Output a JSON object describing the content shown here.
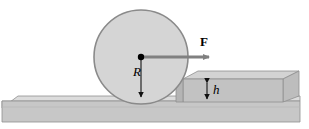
{
  "figure": {
    "name": "wheel-over-step-free-body-diagram",
    "background_color": "#ffffff",
    "width": 309,
    "height": 129
  },
  "labels": {
    "force": "F",
    "radius": "R",
    "step_height": "h"
  },
  "colors": {
    "wheel_fill": "#d5d5d5",
    "wheel_stroke": "#8a8a8a",
    "slab_top": "#d9d9d9",
    "slab_front": "#c6c6c6",
    "slab_side": "#b5b5b5",
    "step_top": "#d2d2d2",
    "step_front": "#bdbdbd",
    "outline": "#8f8f8f",
    "arrow_fill": "#808080",
    "dimension_line": "#1a1a1a",
    "center_dot": "#000000"
  },
  "geometry": {
    "wheel": {
      "cx": 141,
      "cy": 57,
      "r": 47
    },
    "center_dot_radius": 3,
    "force_arrow": {
      "x1": 141,
      "y1": 57,
      "x2": 216,
      "y2": 57,
      "direction": "right"
    },
    "radius_arrow": {
      "x1": 141,
      "y1": 57,
      "x2": 141,
      "y2": 103,
      "direction": "down"
    },
    "height_arrow": {
      "x": 207,
      "y1": 79,
      "y2": 103,
      "direction": "both"
    },
    "lower_slab": {
      "left": 2,
      "right": 300,
      "top_front": 101,
      "bottom": 122,
      "back_top": 95,
      "depth_x": 16,
      "depth_y": 7
    },
    "upper_step": {
      "left": 183,
      "right": 299,
      "top_front": 79,
      "bottom": 102,
      "back_top": 71,
      "depth_x": 15,
      "depth_y": 8
    }
  },
  "elements": {
    "wheel_name": "wheel-circle",
    "lower_slab_name": "lower-slab",
    "upper_step_name": "upper-step-block",
    "force_arrow_name": "force-arrow",
    "radius_arrow_name": "radius-dimension-arrow",
    "height_arrow_name": "height-dimension-arrow",
    "center_dot_name": "wheel-center-dot"
  }
}
